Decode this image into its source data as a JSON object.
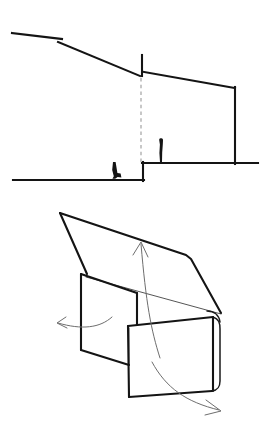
{
  "sheet": {
    "title": "Architectural section and folded-plane axonometric",
    "background_color": "#ffffff",
    "width": 272,
    "height": 428
  },
  "colors": {
    "ink_heavy": "#141414",
    "ink_medium": "#1a1a1a",
    "ink_thin": "#2a2a2a",
    "dashed_gray": "#9a9a9a",
    "arrow_gray": "#6e6e6e",
    "paper": "#ffffff"
  },
  "drawings": [
    {
      "id": "section",
      "name": "building-section",
      "label": "Section through sloping site",
      "elements": {
        "upper_roof_slope": {
          "name": "upper-roof-slope-line",
          "description": "Long shallow line descending left to right from hilltop",
          "points": "12,33 62,39"
        },
        "roof_slope_lower": {
          "name": "lower-roof-slope-line",
          "description": "Continues the descent down to the ridge break",
          "points": "58,42 140,76"
        },
        "ridge_tick": {
          "name": "ridge-vertical-tick",
          "description": "Short vertical tick rising at the ridge break",
          "points": "142,76 142,55"
        },
        "right_roof": {
          "name": "right-roof-line",
          "description": "Shallow roof sloping down to the right parapet",
          "points": "144,72 235,88"
        },
        "right_wall": {
          "name": "right-exterior-wall",
          "description": "Vertical wall down to the terrace",
          "points": "235,88 235,163"
        },
        "upper_terrace": {
          "name": "upper-terrace-ground-line",
          "description": "Raised ground / terrace level",
          "points": "143,163 258,163"
        },
        "terrace_riser": {
          "name": "terrace-riser",
          "description": "Vertical step between lower and upper ground",
          "points": "143,163 143,180"
        },
        "lower_ground": {
          "name": "lower-ground-line",
          "description": "Lower ground datum line",
          "points": "13,180 143,180"
        },
        "section_cut": {
          "name": "section-cut-dashed-line",
          "description": "Vertical gray dashed line marking the cut plane",
          "points": "141,78 141,163",
          "style": "dashed"
        }
      },
      "figures": [
        {
          "name": "seated-human-figure",
          "label": "seated person",
          "position": "lower ground, left of the step",
          "x": 116,
          "y": 180
        },
        {
          "name": "standing-human-figure",
          "label": "standing person",
          "position": "upper terrace, right of the cut line",
          "x": 162,
          "y": 163
        }
      ]
    },
    {
      "id": "axonometric",
      "name": "folded-plane-axonometric",
      "label": "Folded roof plane axonometric with movement arrows",
      "elements": {
        "roof_plane": {
          "name": "folded-roof-plane",
          "description": "Large triangular/quadrilateral folded roof plane with apex at upper left",
          "points": "60,18 188,62 200,75 225,120 88,80"
        },
        "roof_fold_edge": {
          "name": "roof-fold-edge",
          "description": "Thin fold crease running from left panel top to the right corner",
          "points": "85,82 225,120"
        },
        "left_panel": {
          "name": "left-vertical-panel",
          "description": "Left upright parallelogram panel",
          "points": "82,48 82,153 135,177 135,85"
        },
        "left_panel_top": {
          "name": "left-panel-top-edge",
          "points": "82,48 138,84"
        },
        "front_panel": {
          "name": "front-vertical-panel",
          "description": "Lower right upright panel with rounded right edge",
          "points": "130,130 215,122 215,196 130,200"
        },
        "front_panel_round_edge": {
          "name": "front-panel-rounded-edge",
          "description": "Rolled / curved right edge of the front panel",
          "points": "215,122 222,126 222,192 215,196"
        },
        "corner_fold": {
          "name": "corner-fold-detail",
          "description": "Rounded corner where roof meets the front panel",
          "x": 220,
          "y": 122
        }
      },
      "arrows": [
        {
          "name": "arrow-left",
          "label": "left-swing movement arrow",
          "direction": "left",
          "path": "110,122 85,131 60,126"
        },
        {
          "name": "arrow-up",
          "label": "upward-lift movement arrow",
          "direction": "up",
          "path": "158,160 147,120 140,48"
        },
        {
          "name": "arrow-down-right",
          "label": "down-right swing movement arrow",
          "direction": "down-right",
          "path": "152,168 180,200 218,215"
        }
      ]
    }
  ]
}
